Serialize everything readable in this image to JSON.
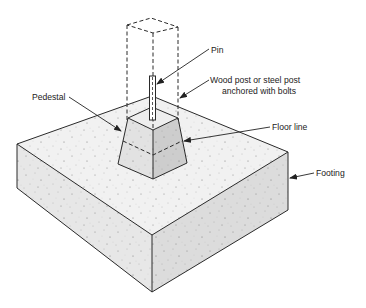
{
  "diagram": {
    "labels": {
      "pin": "Pin",
      "post_line1": "Wood post or steel post",
      "post_line2": "anchored with bolts",
      "pedestal": "Pedestal",
      "floor_line": "Floor line",
      "footing": "Footing"
    },
    "colors": {
      "outline": "#2a2a2a",
      "footing_top": "#f1f1f1",
      "footing_left": "#e7e7e7",
      "footing_right": "#dcdcdc",
      "pedestal_left": "#e2e2e2",
      "pedestal_right": "#cdcdcd",
      "pedestal_top": "#eeeeee"
    }
  }
}
